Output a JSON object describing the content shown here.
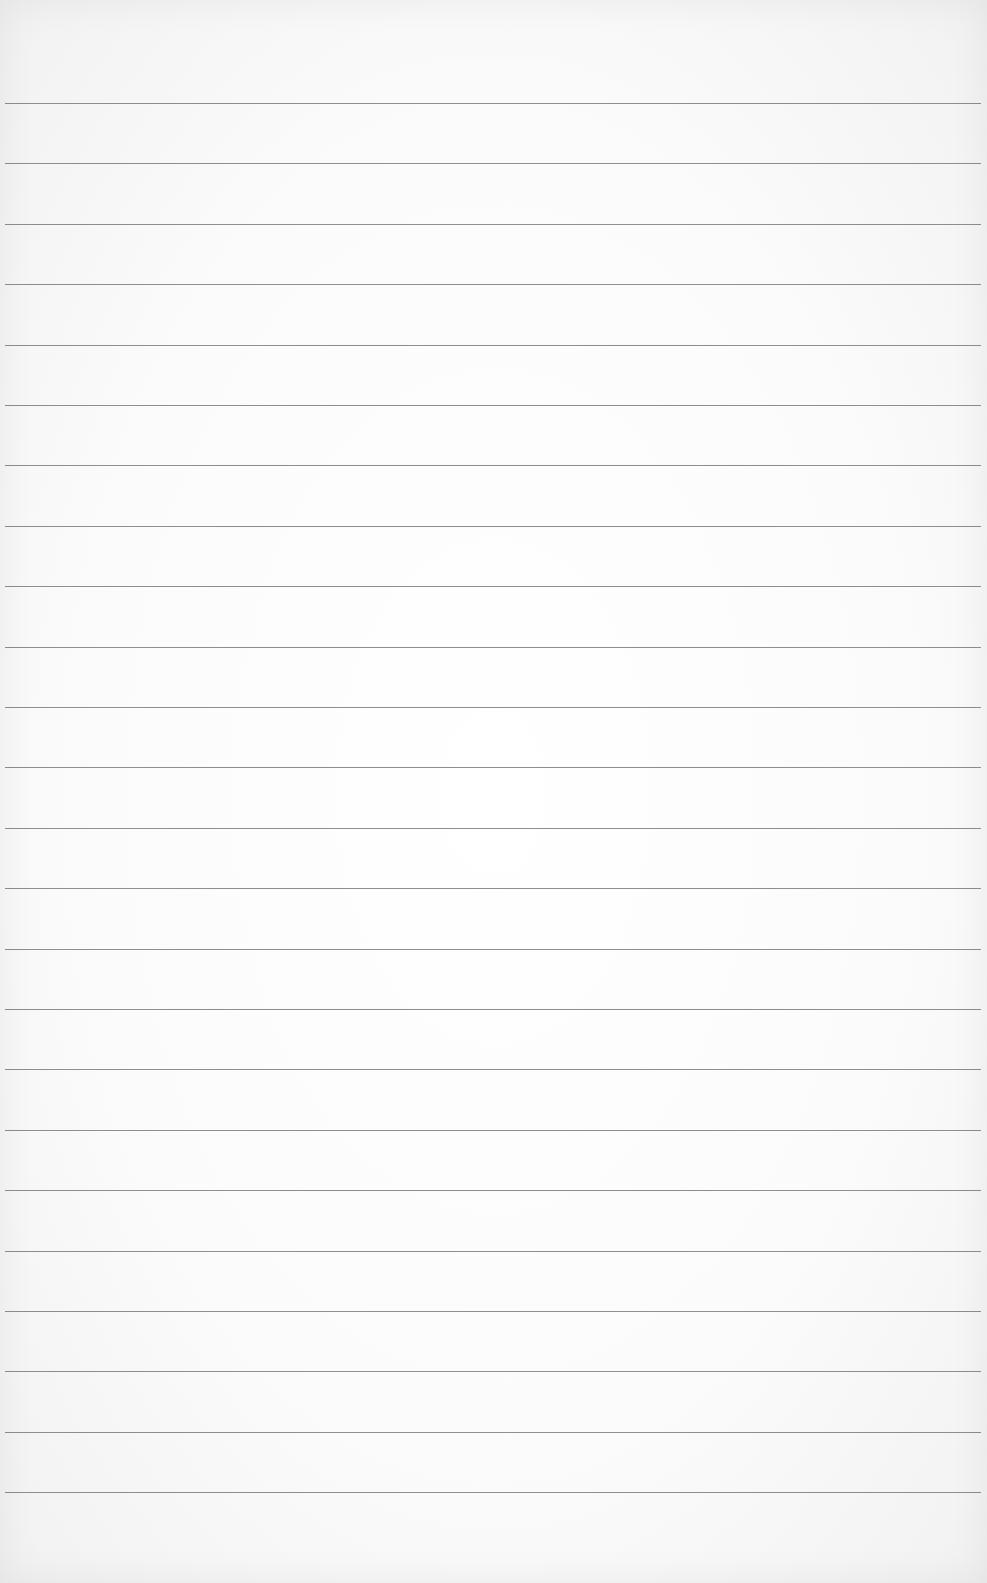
{
  "page": {
    "type": "lined-paper",
    "background_color": "#fdfdfd",
    "line_color": "#7a7a7a",
    "line_count": 24,
    "first_line_y": 103,
    "line_spacing": 60.4,
    "line_left": 5,
    "line_width": 976
  }
}
